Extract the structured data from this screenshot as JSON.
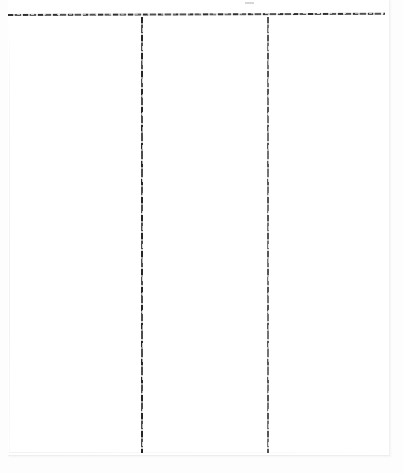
{
  "document": {
    "kind": "scanned-paper-sheet",
    "title": "Blank ruled ledger sheet",
    "orientation": "portrait",
    "background_color": "#ffffff",
    "paper_color": "#ffffff",
    "ink_color": "#1e1e1e",
    "faint_edge_color": "#f1f1f1"
  },
  "rules": {
    "horizontal": [
      {
        "name": "top-border-rule",
        "orientation": "horizontal",
        "x_start": 8,
        "x_end": 385,
        "y": 15,
        "thickness_px": 2,
        "ink_color": "#1e1e1e",
        "quality": "broken, gritty, slightly skewed"
      }
    ],
    "vertical": [
      {
        "name": "column-divider-1",
        "orientation": "vertical",
        "x": 141,
        "y_start": 17,
        "y_end": 453,
        "thickness_px": 2,
        "ink_color": "#191919",
        "quality": "broken, gritty"
      },
      {
        "name": "column-divider-2",
        "orientation": "vertical",
        "x": 267,
        "y_start": 17,
        "y_end": 453,
        "thickness_px": 2,
        "ink_color": "#2d2d2d",
        "quality": "broken, gritty, lighter than divider-1"
      }
    ]
  },
  "columns": [
    {
      "name": "left-column",
      "content": "",
      "x": 10,
      "width": 130
    },
    {
      "name": "middle-column",
      "content": "",
      "x": 144,
      "width": 122
    },
    {
      "name": "right-column",
      "content": "",
      "x": 270,
      "width": 115
    }
  ],
  "artifacts": [
    {
      "name": "stray-speck",
      "x": 245,
      "y": 2,
      "width": 9,
      "height": 2,
      "color": "#787878"
    },
    {
      "name": "paper-edge-left",
      "x": 9,
      "y_start": 20,
      "y_end": 452
    },
    {
      "name": "paper-edge-bottom",
      "y": 452,
      "x_start": 9,
      "x_end": 386
    }
  ],
  "text": {
    "visible_text": "",
    "note": "No legible text is present anywhere in the scan."
  }
}
